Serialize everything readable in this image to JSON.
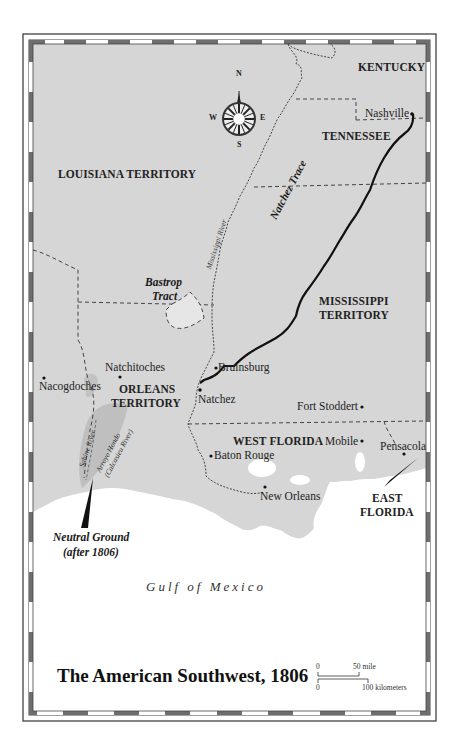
{
  "map": {
    "title": "The American Southwest, 1806",
    "water_label": "Gulf of Mexico",
    "colors": {
      "land": "#d6d6d6",
      "water": "#ffffff",
      "border_dark": "#5a5a5a",
      "frame_line": "#333333",
      "route": "#111111"
    },
    "compass": {
      "north": "N",
      "south": "S",
      "east": "E",
      "west": "W"
    },
    "regions": {
      "kentucky": "KENTUCKY",
      "tennessee": "TENNESSEE",
      "louisiana_territory": "LOUISIANA TERRITORY",
      "mississippi_territory_1": "MISSISSIPPI",
      "mississippi_territory_2": "TERRITORY",
      "orleans_territory_1": "ORLEANS",
      "orleans_territory_2": "TERRITORY",
      "west_florida": "WEST FLORIDA",
      "east_florida_1": "EAST",
      "east_florida_2": "FLORIDA"
    },
    "cities": {
      "nashville": "Nashville",
      "natchitoches": "Natchitoches",
      "nacogdoches": "Nacogdoches",
      "bruinsburg": "Bruinsburg",
      "natchez": "Natchez",
      "fort_stoddert": "Fort Stoddert",
      "mobile": "Mobile",
      "pensacola": "Pensacola",
      "baton_rouge": "Baton Rouge",
      "new_orleans": "New Orleans"
    },
    "features": {
      "bastrop_1": "Bastrop",
      "bastrop_2": "Tract",
      "natchez_trace": "Natchez Trace",
      "mississippi_river": "Mississippi River",
      "sabine_river": "Sabine River",
      "arroyo_hondo_1": "Arroyo Hondo",
      "arroyo_hondo_2": "(Calcasieu River)",
      "neutral_ground_1": "Neutral Ground",
      "neutral_ground_2": "(after 1806)"
    },
    "scale": {
      "mile_zero": "0",
      "mile_label": "50 mile",
      "km_zero": "0",
      "km_label": "100 kilometers"
    }
  }
}
